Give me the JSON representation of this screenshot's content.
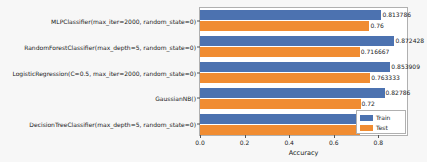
{
  "chart_data": {
    "type": "bar",
    "orientation": "horizontal",
    "title": "",
    "xlabel": "Accuracy",
    "ylabel": "",
    "xlim": [
      0.0,
      0.9375
    ],
    "xticks": [
      "0.0",
      "0.2",
      "0.4",
      "0.6",
      "0.8"
    ],
    "xtick_values": [
      0.0,
      0.2,
      0.4,
      0.6,
      0.8
    ],
    "grid": false,
    "legend_position": "lower right",
    "categories": [
      "DecisionTreeClassifier(max_depth=5, random_state=0)",
      "GaussianNB()",
      "LogisticRegression(C=0.5, max_iter=2000, random_state=0)",
      "RandomForestClassifier(max_depth=5, random_state=0)",
      "MLPClassifier(max_iter=2000, random_state=0)"
    ],
    "series": [
      {
        "name": "Train",
        "color": "#4c72b0",
        "values": [
          0.7736,
          0.82786,
          0.853909,
          0.872428,
          0.813786
        ],
        "labels": [
          "0.7736",
          "0.82786",
          "0.853909",
          "0.872428",
          "0.813786"
        ]
      },
      {
        "name": "Test",
        "color": "#f08c32",
        "values": [
          0.716667,
          0.72,
          0.763333,
          0.716667,
          0.76
        ],
        "labels": [
          "0.716667",
          "0.72",
          "0.763333",
          "0.716667",
          "0.76"
        ]
      }
    ]
  },
  "legend": {
    "entries": [
      {
        "label": "Train",
        "color": "#4c72b0"
      },
      {
        "label": "Test",
        "color": "#f08c32"
      }
    ]
  },
  "axis": {
    "xlabel": "Accuracy"
  }
}
